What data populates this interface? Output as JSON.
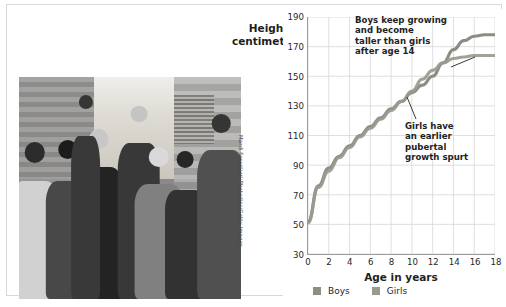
{
  "figure": {
    "photo_credit": "Mardi Forastieri/Photodisc/Getty Images",
    "photo_alt": "group-of-teenagers-standing-on-a-city-street"
  },
  "chart_data": {
    "type": "line",
    "title": "",
    "xlabel": "Age in years",
    "ylabel": "Height in\ncentimeters",
    "ylabel_line1": "Height in",
    "ylabel_line2": "centimeters",
    "xlim": [
      0,
      18
    ],
    "ylim": [
      30,
      190
    ],
    "xticks": [
      0,
      2,
      4,
      6,
      8,
      10,
      12,
      14,
      16,
      18
    ],
    "yticks": [
      30,
      50,
      70,
      90,
      110,
      130,
      150,
      170,
      190
    ],
    "grid": true,
    "legend_position": "bottom-left",
    "x": [
      0,
      1,
      2,
      3,
      4,
      5,
      6,
      7,
      8,
      9,
      10,
      11,
      12,
      13,
      14,
      15,
      16,
      17,
      18
    ],
    "series": [
      {
        "name": "Boys",
        "color": "#8d8d84",
        "values": [
          52,
          76,
          88,
          96,
          103,
          110,
          116,
          122,
          128,
          133,
          139,
          144,
          150,
          159,
          168,
          174,
          177,
          178,
          178
        ]
      },
      {
        "name": "Girls",
        "color": "#9a9a90",
        "values": [
          51,
          75,
          86,
          95,
          102,
          109,
          115,
          121,
          127,
          133,
          140,
          148,
          154,
          159,
          162,
          163,
          164,
          164,
          164
        ]
      }
    ],
    "annotations": [
      {
        "id": "boys-annotation",
        "text": "Boys keep growing and become taller than girls after age 14",
        "lines": [
          "Boys keep growing",
          "and become",
          "taller than girls",
          "after age 14"
        ],
        "points_to": "boys-line-after-age-14"
      },
      {
        "id": "girls-annotation",
        "text": "Girls have an earlier pubertal growth spurt",
        "lines": [
          "Girls have",
          "an earlier",
          "pubertal",
          "growth spurt"
        ],
        "points_to": "girls-line-age-11"
      }
    ],
    "legend": [
      {
        "label": "Boys",
        "color": "#8d8d84"
      },
      {
        "label": "Girls",
        "color": "#9a9a90"
      }
    ]
  },
  "colors": {
    "panel_border": "#d8d8d8",
    "axis": "#9b9b9b",
    "grid": "#d6d6d6",
    "text": "#1f1f1f"
  }
}
